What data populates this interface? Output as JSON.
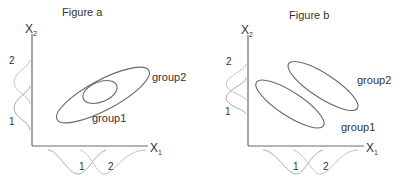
{
  "figures": [
    {
      "id": "a",
      "title": "Figure a",
      "x_axis_label": "X",
      "x_axis_subscript": "1",
      "y_axis_label": "X",
      "y_axis_subscript": "2",
      "groups": [
        {
          "label": "group1",
          "orientation": "positive correlation, small, inside group2"
        },
        {
          "label": "group2",
          "orientation": "positive correlation, large"
        }
      ],
      "x_marginal_labels": [
        "1",
        "2"
      ],
      "y_marginal_labels": [
        "1",
        "2"
      ]
    },
    {
      "id": "b",
      "title": "Figure b",
      "x_axis_label": "X",
      "x_axis_subscript": "1",
      "y_axis_label": "X",
      "y_axis_subscript": "2",
      "groups": [
        {
          "label": "group1",
          "orientation": "negative correlation, lower-left"
        },
        {
          "label": "group2",
          "orientation": "negative correlation, upper-right"
        }
      ],
      "x_marginal_labels": [
        "1",
        "2"
      ],
      "y_marginal_labels": [
        "1",
        "2"
      ]
    }
  ],
  "colors": {
    "axis": "#6b6b6b",
    "ellipse": "#6a6a6a",
    "marginal_1": "#a9a9a9",
    "marginal_2": "#c4c4c4",
    "text": "#333333"
  }
}
